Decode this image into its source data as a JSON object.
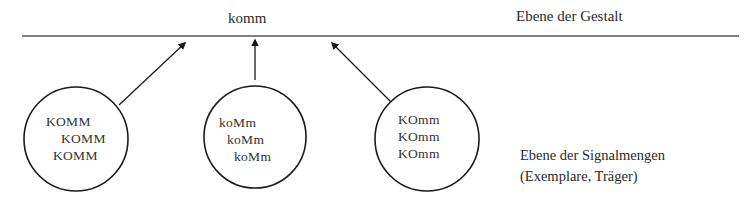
{
  "gestalt": {
    "word": "komm",
    "level_label": "Ebene der Gestalt"
  },
  "signal_level": {
    "line1": "Ebene der Signalmengen",
    "line2": "(Exemplare, Träger)"
  },
  "circles": [
    {
      "lines": [
        "KOMM",
        "KOMM",
        "KOMM"
      ]
    },
    {
      "lines": [
        "koMm",
        "koMm",
        "koMm"
      ]
    },
    {
      "lines": [
        "KOmm",
        "KOmm",
        "KOmm"
      ]
    }
  ],
  "colors": {
    "stroke": "#1a1a1a",
    "line": "#555555",
    "background": "#ffffff"
  }
}
